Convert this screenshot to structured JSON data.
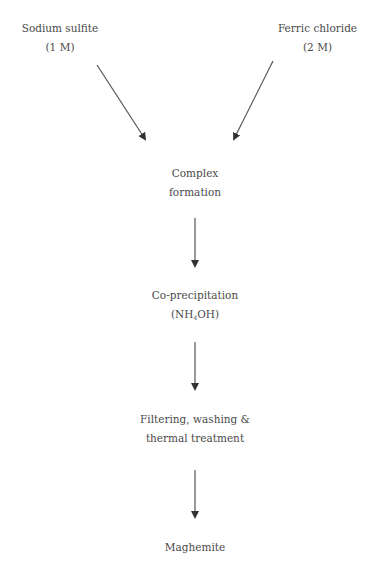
{
  "diagram": {
    "type": "flowchart",
    "inputs": [
      {
        "name": "Sodium sulfite",
        "concentration": "(1 M)"
      },
      {
        "name": "Ferric chloride",
        "concentration": "(2 M)"
      }
    ],
    "steps": [
      {
        "line1": "Complex",
        "line2": "formation"
      },
      {
        "line1": "Co-precipitation",
        "line2_prefix": "(NH",
        "line2_sub": "4",
        "line2_suffix": "OH)"
      },
      {
        "line1": "Filtering, washing &",
        "line2": "thermal treatment"
      },
      {
        "line1": "Maghemite"
      }
    ],
    "colors": {
      "text": "#4a4a4a",
      "arrow": "#333333",
      "background": "#ffffff"
    }
  }
}
